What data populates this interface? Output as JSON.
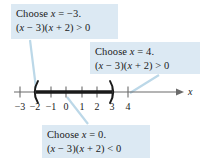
{
  "figure": {
    "background_color": "#ffffff",
    "callout_fill": "#dce9f3",
    "leader_color": "#bcd8e8",
    "axis_color": "#6b6b6b",
    "solution_color": "#1a1a1a"
  },
  "callouts": [
    {
      "id": "choose-neg3",
      "line1": "Choose x = −3.",
      "line2": "(x − 3)(x + 2) > 0",
      "test_value": -3,
      "sign": ">"
    },
    {
      "id": "choose-4",
      "line1": "Choose x = 4.",
      "line2": "(x − 3)(x + 2) > 0",
      "test_value": 4,
      "sign": ">"
    },
    {
      "id": "choose-0",
      "line1": "Choose x = 0.",
      "line2": "(x − 3)(x + 2) < 0",
      "test_value": 0,
      "sign": "<"
    }
  ],
  "number_line": {
    "axis_label": "x",
    "ticks": [
      {
        "value": -3,
        "label": "−3",
        "x": 20
      },
      {
        "value": -2,
        "label": "−2",
        "x": 35
      },
      {
        "value": -1,
        "label": "−1",
        "x": 51
      },
      {
        "value": 0,
        "label": "0",
        "x": 66
      },
      {
        "value": 1,
        "label": "1",
        "x": 82
      },
      {
        "value": 2,
        "label": "2",
        "x": 97
      },
      {
        "value": 3,
        "label": "3",
        "x": 112
      },
      {
        "value": 4,
        "label": "4",
        "x": 128
      }
    ],
    "interval": {
      "left_endpoint": -2,
      "right_endpoint": 3,
      "left_bracket": "(",
      "right_bracket": ")",
      "included": false
    }
  },
  "leaders": [
    {
      "id": "leader-neg3",
      "from_x": 30,
      "from_y": 40,
      "to_x": 36,
      "to_y": 88
    },
    {
      "id": "leader-4",
      "from_x": 159,
      "from_y": 75,
      "to_x": 130,
      "to_y": 93
    },
    {
      "id": "leader-0",
      "from_x": 88,
      "from_y": 124,
      "to_x": 67,
      "to_y": 97
    }
  ]
}
